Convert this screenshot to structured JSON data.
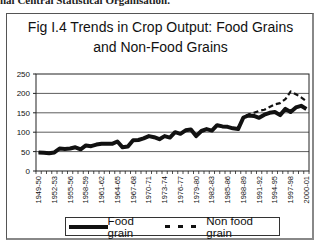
{
  "header": {
    "cut_text": "nal Central Statistical Organisation."
  },
  "chart_data": {
    "type": "line",
    "title": "Fig I.4 Trends in Crop Output: Food Grains and Non-Food Grains",
    "title_lines": [
      "Fig I.4 Trends in Crop Output: Food Grains",
      "and Non-Food Grains"
    ],
    "xlabel": "",
    "ylabel": "",
    "ylim": [
      0,
      250
    ],
    "yticks": [
      0,
      50,
      100,
      150,
      200,
      250
    ],
    "grid": true,
    "legend_position": "bottom",
    "x": [
      "1949-50",
      "1950-51",
      "1951-52",
      "1952-53",
      "1953-54",
      "1954-55",
      "1955-56",
      "1956-57",
      "1957-58",
      "1958-59",
      "1959-60",
      "1960-61",
      "1961-62",
      "1962-63",
      "1963-64",
      "1964-65",
      "1965-66",
      "1966-67",
      "1967-68",
      "1968-69",
      "1969-70",
      "1970-71",
      "1971-72",
      "1972-73",
      "1973-74",
      "1974-75",
      "1975-76",
      "1976-77",
      "1977-78",
      "1978-79",
      "1979-80",
      "1980-81",
      "1981-82",
      "1982-83",
      "1983-84",
      "1984-85",
      "1985-86",
      "1986-87",
      "1987-88",
      "1988-89",
      "1989-90",
      "1990-91",
      "1991-92",
      "1992-93",
      "1993-94",
      "1994-95",
      "1995-96",
      "1996-97",
      "1997-98",
      "1998-99",
      "1999-00",
      "2000-01"
    ],
    "xtick_labels": [
      "1949-50",
      "1952-53",
      "1955-56",
      "1958-59",
      "1961-62",
      "1964-65",
      "1967-68",
      "1970-71",
      "1973-74",
      "1976-77",
      "1979-80",
      "1982-83",
      "1985-86",
      "1988-89",
      "1991-92",
      "1994-95",
      "1997-98",
      "2000-01"
    ],
    "series": [
      {
        "name": "Food grain",
        "style": "solid",
        "values": [
          48,
          47,
          46,
          48,
          58,
          57,
          58,
          61,
          56,
          66,
          64,
          68,
          70,
          70,
          70,
          76,
          61,
          63,
          79,
          80,
          84,
          90,
          87,
          82,
          90,
          86,
          100,
          96,
          105,
          107,
          90,
          103,
          108,
          104,
          118,
          115,
          114,
          110,
          108,
          138,
          143,
          142,
          137,
          145,
          150,
          152,
          144,
          160,
          152,
          164,
          168,
          160
        ]
      },
      {
        "name": "Non food grain",
        "style": "dashed",
        "values": [
          48,
          47,
          46,
          48,
          58,
          57,
          58,
          61,
          56,
          66,
          64,
          68,
          70,
          70,
          70,
          76,
          61,
          63,
          79,
          80,
          84,
          90,
          87,
          82,
          90,
          86,
          100,
          96,
          105,
          107,
          90,
          103,
          108,
          104,
          118,
          115,
          114,
          110,
          108,
          140,
          146,
          150,
          155,
          158,
          165,
          172,
          175,
          185,
          205,
          198,
          190,
          180
        ]
      }
    ]
  },
  "legend": {
    "items": [
      {
        "label": "Food grain"
      },
      {
        "label": "Non food grain"
      }
    ]
  }
}
